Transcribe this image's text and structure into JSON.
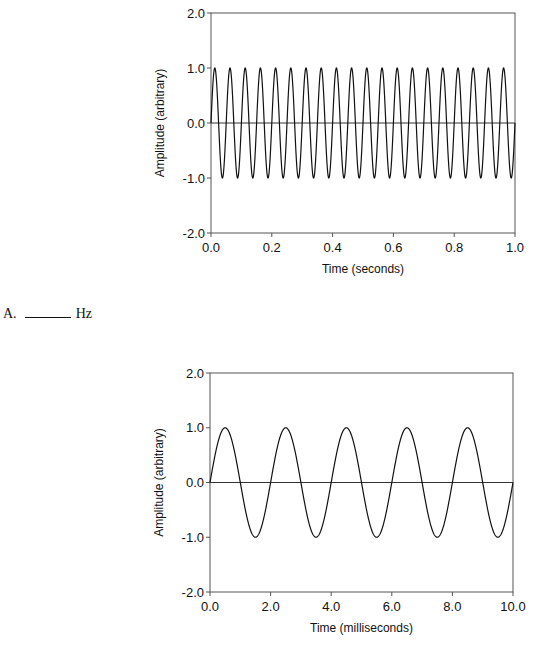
{
  "chart_data": [
    {
      "type": "line",
      "title": "",
      "xlabel": "Time (seconds)",
      "ylabel": "Amplitude (arbitrary)",
      "xlim": [
        0.0,
        1.0
      ],
      "ylim": [
        -2.0,
        2.0
      ],
      "x_ticks": [
        "0.0",
        "0.2",
        "0.4",
        "0.6",
        "0.8",
        "1.0"
      ],
      "y_ticks": [
        "2.0",
        "1.0",
        "0.0",
        "-1.0",
        "-2.0"
      ],
      "grid": false,
      "series": [
        {
          "name": "sine wave",
          "function": "sin(2*pi*f*t)",
          "frequency_hz": 20,
          "amplitude": 1.0,
          "cycles_shown": 20
        }
      ],
      "zero_line": true
    },
    {
      "type": "line",
      "title": "",
      "xlabel": "Time (milliseconds)",
      "ylabel": "Amplitude (arbitrary)",
      "xlim": [
        0.0,
        10.0
      ],
      "ylim": [
        -2.0,
        2.0
      ],
      "x_ticks": [
        "0.0",
        "2.0",
        "4.0",
        "6.0",
        "8.0",
        "10.0"
      ],
      "y_ticks": [
        "2.0",
        "1.0",
        "0.0",
        "-1.0",
        "-2.0"
      ],
      "grid": false,
      "series": [
        {
          "name": "sine wave",
          "function": "sin(2*pi*f*t)",
          "period_ms": 2.0,
          "amplitude": 1.0,
          "cycles_shown": 5
        }
      ],
      "zero_line": true
    }
  ],
  "question": {
    "label": "A.",
    "unit": "Hz"
  }
}
